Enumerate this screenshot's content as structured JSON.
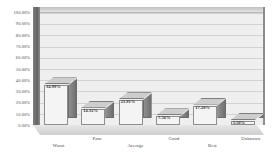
{
  "chart_data": {
    "type": "bar",
    "title": "",
    "subtitle": "",
    "xlabel": "",
    "ylabel": "",
    "categories": [
      "Worst",
      "Poor",
      "Average",
      "Good",
      "Best",
      "Unknown"
    ],
    "values": [
      34.99,
      14.32,
      21.91,
      7.56,
      17.2,
      3.5
    ],
    "data_labels": [
      "34.99%",
      "14.32%",
      "21.91%",
      "7.56%",
      "17.20%",
      "3.50%"
    ],
    "ylim": [
      0,
      100
    ],
    "y_tick_values": [
      100,
      90,
      80,
      70,
      60,
      50,
      40,
      30,
      20,
      10,
      0
    ],
    "y_tick_labels": [
      "100.00%",
      "90.00%",
      "80.00%",
      "70.00%",
      "60.00%",
      "50.00%",
      "40.00%",
      "30.00%",
      "20.00%",
      "10.00%",
      "0.00%"
    ],
    "grid": true,
    "legend": false,
    "legend_position": "none",
    "style": "3d-column-grayscale",
    "colors": {
      "bar_front": "#f4f4f4",
      "bar_side": "#7f7f7f",
      "bar_top": "#cdcdcd",
      "plot_background": "#efefef",
      "gridline": "#d2d2d2",
      "left_wall": "#646464",
      "text": "#3a3a3a"
    }
  }
}
